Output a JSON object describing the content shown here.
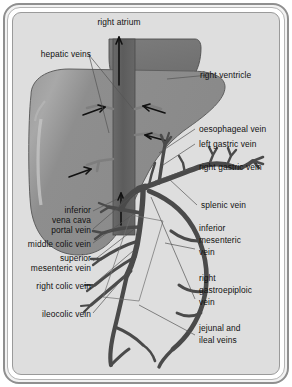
{
  "diagram": {
    "type": "anatomical-illustration",
    "background_color": "#dedede",
    "frame_color": "#8f8f8f",
    "vein_color": "#4a4a4a",
    "liver_color": "#8e8e8e",
    "heart_color": "#747474",
    "ivc_color": "#5f5f5f",
    "leader_color": "#555555"
  },
  "labels": {
    "right_atrium": "right atrium",
    "right_ventricle": "right ventricle",
    "hepatic_veins": "hepatic veins",
    "oesophageal_vein": "oesophageal vein",
    "left_gastric_vein": "left gastric vein",
    "right_gastric_vein": "right gastric vein",
    "splenic_vein": "splenic vein",
    "inferior_vena_cava_l1": "inferior",
    "inferior_vena_cava_l2": "vena cava",
    "portal_vein": "portal vein",
    "middle_colic_vein": "middle colic vein",
    "superior_mesenteric_l1": "superior",
    "superior_mesenteric_l2": "mesenteric vein",
    "right_colic_vein": "right colic vein",
    "ileocolic_vein": "ileocolic vein",
    "inferior_mesenteric_l1": "inferior",
    "inferior_mesenteric_l2": "mesenteric",
    "inferior_mesenteric_l3": "vein",
    "right_gastroepiploic_l1": "right",
    "right_gastroepiploic_l2": "gastroepiploic",
    "right_gastroepiploic_l3": "vein",
    "jejunal_ileal_l1": "jejunal and",
    "jejunal_ileal_l2": "ileal veins"
  }
}
